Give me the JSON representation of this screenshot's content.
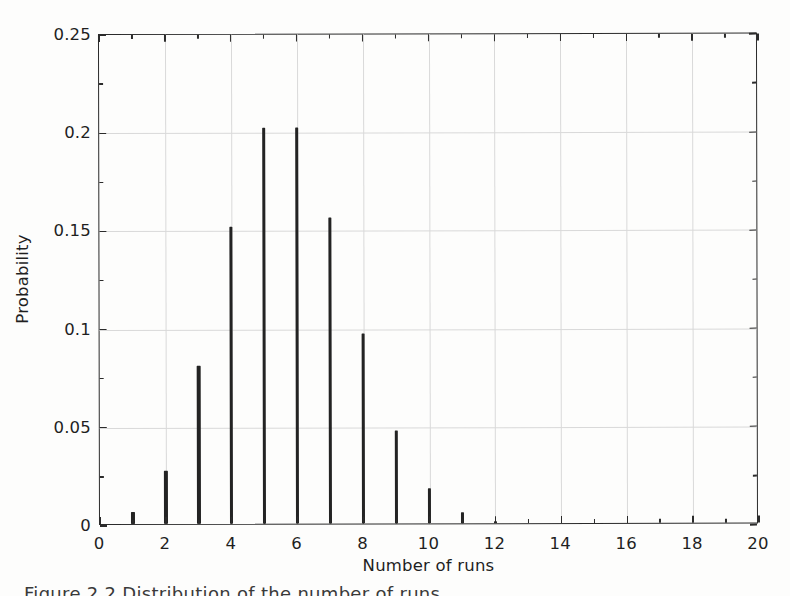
{
  "figure": {
    "caption_fragment": "Figure 2.2  Distribution of the number of runs"
  },
  "axes": {
    "xlabel": "Number of runs",
    "ylabel": "Probability",
    "xticklabels": [
      "0",
      "2",
      "4",
      "6",
      "8",
      "10",
      "12",
      "14",
      "16",
      "18",
      "20"
    ],
    "yticklabels": [
      "0",
      "0.05",
      "0.1",
      "0.15",
      "0.2",
      "0.25"
    ]
  },
  "chart_data": {
    "type": "bar",
    "title": "",
    "xlabel": "Number of runs",
    "ylabel": "Probability",
    "xlim": [
      0,
      20
    ],
    "ylim": [
      0,
      0.25
    ],
    "xticks": [
      0,
      2,
      4,
      6,
      8,
      10,
      12,
      14,
      16,
      18,
      20
    ],
    "yticks": [
      0,
      0.05,
      0.1,
      0.15,
      0.2,
      0.25
    ],
    "x_minor_tick_step": 1,
    "grid": true,
    "legend": null,
    "style": "stem",
    "stem_color": "#232323",
    "grid_color": "#d9d9d9",
    "categories": [
      0,
      1,
      2,
      3,
      4,
      5,
      6,
      7,
      8,
      9,
      10,
      11,
      12,
      13,
      14,
      15,
      16,
      17,
      18,
      19,
      20
    ],
    "values": [
      0,
      0.006,
      0.027,
      0.0805,
      0.151,
      0.2015,
      0.2015,
      0.156,
      0.0965,
      0.0475,
      0.018,
      0.0055,
      0.0008,
      0,
      0,
      0,
      0,
      0,
      0,
      0,
      0
    ]
  }
}
